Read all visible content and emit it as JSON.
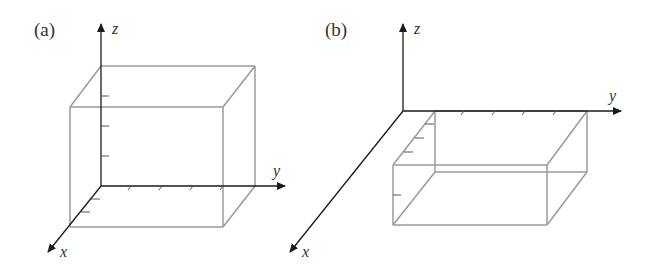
{
  "figure": {
    "panels": [
      {
        "id": "a",
        "label": "(a)",
        "axes": {
          "x": "x",
          "y": "y",
          "z": "z"
        },
        "description": "Rectangular box sitting in the first octant with one corner at the origin, extending above the xy-plane"
      },
      {
        "id": "b",
        "label": "(b)",
        "axes": {
          "x": "x",
          "y": "y",
          "z": "z"
        },
        "description": "Rectangular box with its top face in the xy-plane, extending below the xy-plane"
      }
    ],
    "colors": {
      "axis": "#1a1a1a",
      "box_edge": "#9a9a9a",
      "tick": "#555555",
      "text": "#333333"
    }
  }
}
